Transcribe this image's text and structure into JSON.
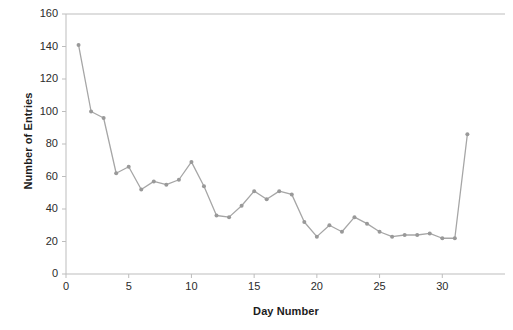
{
  "chart_data": {
    "type": "line",
    "title": "",
    "xlabel": "Day Number",
    "ylabel": "Number of Entries",
    "xlim": [
      0,
      35
    ],
    "ylim": [
      0,
      160
    ],
    "grid": false,
    "legend": null,
    "marker": "circle",
    "series_color": "#a6a6a6",
    "x": [
      1,
      2,
      3,
      4,
      5,
      6,
      7,
      8,
      9,
      10,
      11,
      12,
      13,
      14,
      15,
      16,
      17,
      18,
      19,
      20,
      21,
      22,
      23,
      24,
      25,
      26,
      27,
      28,
      29,
      30,
      31,
      32
    ],
    "values": [
      141,
      100,
      96,
      62,
      66,
      52,
      57,
      55,
      58,
      69,
      54,
      36,
      35,
      42,
      51,
      46,
      51,
      49,
      32,
      23,
      30,
      26,
      35,
      31,
      26,
      23,
      24,
      24,
      25,
      22,
      22,
      86
    ],
    "series": [
      {
        "name": "Entries",
        "values": [
          141,
          100,
          96,
          62,
          66,
          52,
          57,
          55,
          58,
          69,
          54,
          36,
          35,
          42,
          51,
          46,
          51,
          49,
          32,
          23,
          30,
          26,
          35,
          31,
          26,
          23,
          24,
          24,
          25,
          22,
          22,
          86
        ]
      }
    ],
    "ytick_labels": [
      "0",
      "20",
      "40",
      "60",
      "80",
      "100",
      "120",
      "140",
      "160"
    ],
    "ytick_values": [
      0,
      20,
      40,
      60,
      80,
      100,
      120,
      140,
      160
    ],
    "xtick_labels": [
      "0",
      "5",
      "10",
      "15",
      "20",
      "25",
      "30"
    ],
    "xtick_values": [
      0,
      5,
      10,
      15,
      20,
      25,
      30
    ]
  },
  "colors": {
    "line": "#a6a6a6",
    "marker": "#999999",
    "axis": "#b5b5b5",
    "text": "#2b2b2b",
    "title_text": "#1c1c1c",
    "background": "#ffffff"
  }
}
